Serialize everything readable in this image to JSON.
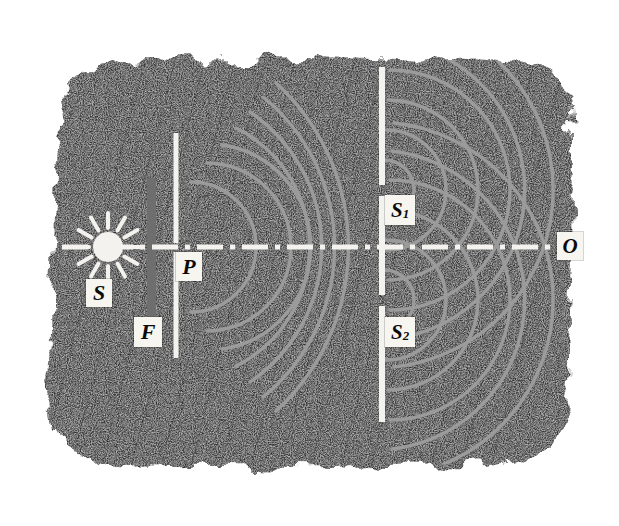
{
  "figure": {
    "medium": "stippled pen-and-ink drawing",
    "background_color": "#ffffff",
    "field_color": "#2b2b2b",
    "wave_color": "#9a9a9a",
    "barrier_color": "#f4f2ee",
    "axis_color": "#f4f2ee",
    "filter_color": "#6e6e6e",
    "label_box_color": "#f7f5f0",
    "label_text_color": "#0b0b0b"
  },
  "labels": [
    {
      "id": "S",
      "text": "S",
      "sub": "",
      "x": 86,
      "y": 279,
      "w": 26,
      "h": 28,
      "font_size": 22,
      "title": "light source"
    },
    {
      "id": "F",
      "text": "F",
      "sub": "",
      "x": 134,
      "y": 317,
      "w": 28,
      "h": 30,
      "font_size": 22,
      "title": "filter"
    },
    {
      "id": "P",
      "text": "P",
      "sub": "",
      "x": 176,
      "y": 252,
      "w": 26,
      "h": 29,
      "font_size": 22,
      "title": "pinhole / first slit"
    },
    {
      "id": "S1",
      "text": "S",
      "sub": "1",
      "x": 385,
      "y": 195,
      "w": 30,
      "h": 30,
      "font_size": 21,
      "title": "first slit"
    },
    {
      "id": "S2",
      "text": "S",
      "sub": "2",
      "x": 385,
      "y": 317,
      "w": 30,
      "h": 30,
      "font_size": 21,
      "title": "second slit"
    },
    {
      "id": "O",
      "text": "O",
      "sub": "",
      "x": 557,
      "y": 232,
      "w": 26,
      "h": 28,
      "font_size": 21,
      "title": "observation point"
    }
  ],
  "optical_axis": {
    "y": 247,
    "x_start": 62,
    "x_end": 560,
    "stroke_width": 5,
    "dash_pattern": "26 7 5 7"
  },
  "source": {
    "name": "sun-symbol",
    "center_x": 108,
    "center_y": 247,
    "disc_radius": 15,
    "ray_count": 12,
    "ray_inner": 19,
    "ray_outer": 34
  },
  "filter_bar": {
    "name": "gray-filter-bar",
    "x": 147,
    "y": 178,
    "w": 9,
    "h": 140
  },
  "barrier_1": {
    "name": "single-slit-barrier",
    "x": 174,
    "y_top": 133,
    "y_bottom": 358,
    "width": 5,
    "slit_y": 247,
    "slit_gap": 9
  },
  "barrier_2": {
    "name": "double-slit-barrier",
    "x": 380,
    "y_top": 67,
    "y_bottom": 422,
    "width": 6,
    "slit1_y": 190,
    "slit2_y": 300,
    "slit_gap": 10
  },
  "waves": {
    "from_pinhole": {
      "origin_x": 174,
      "origin_y": 247,
      "radii": [
        42,
        72,
        103,
        133,
        163,
        193,
        222
      ],
      "angular_half_spread_deg": 66
    },
    "from_slit_1": {
      "origin_x": 382,
      "origin_y": 190,
      "radii": [
        30,
        60,
        90,
        120,
        150,
        178
      ],
      "angular_half_spread_deg": 86
    },
    "from_slit_2": {
      "origin_x": 382,
      "origin_y": 300,
      "radii": [
        30,
        60,
        90,
        120,
        150,
        178
      ],
      "angular_half_spread_deg": 86
    }
  },
  "field_shape": {
    "name": "stippled-ink-field",
    "description": "irregular rounded dark hatched block",
    "left": 48,
    "top": 58,
    "right": 578,
    "bottom": 470
  }
}
